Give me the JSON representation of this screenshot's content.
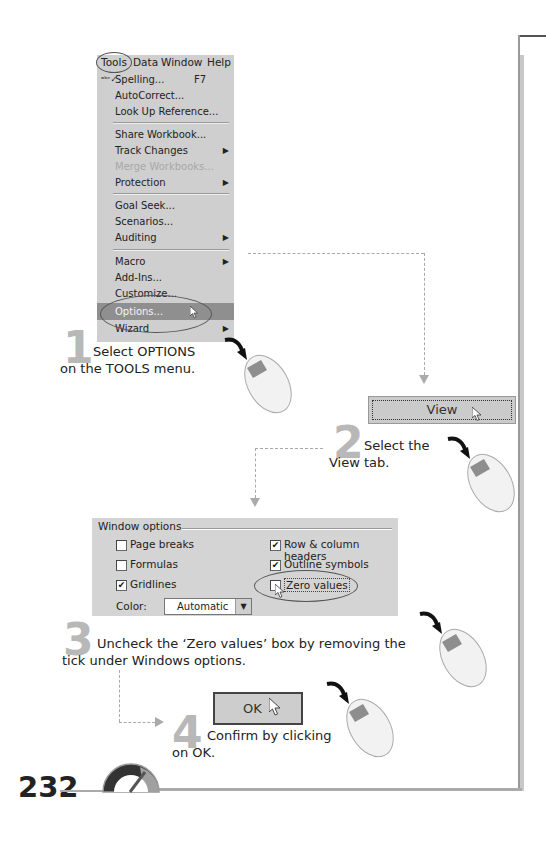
{
  "menu": {
    "menubar": [
      "Tools",
      "Data",
      "Window",
      "Help"
    ],
    "items": [
      {
        "label": "Spelling...",
        "shortcut": "F7",
        "icon": "spelling-icon"
      },
      {
        "label": "AutoCorrect..."
      },
      {
        "label": "Look Up Reference..."
      },
      {
        "label": "Share Workbook..."
      },
      {
        "label": "Track Changes",
        "submenu": true
      },
      {
        "label": "Merge Workbooks...",
        "disabled": true
      },
      {
        "label": "Protection",
        "submenu": true
      },
      {
        "label": "Goal Seek..."
      },
      {
        "label": "Scenarios..."
      },
      {
        "label": "Auditing",
        "submenu": true
      },
      {
        "label": "Macro",
        "submenu": true
      },
      {
        "label": "Add-Ins..."
      },
      {
        "label": "Customize..."
      },
      {
        "label": "Options...",
        "highlighted": true
      },
      {
        "label": "Wizard",
        "submenu": true
      }
    ],
    "submenu_arrow": "▶"
  },
  "steps": [
    {
      "number": "1",
      "text_line1": "Select OPTIONS",
      "text_line2": "on the TOOLS menu."
    },
    {
      "number": "2",
      "text_line1": "Select the",
      "text_line2": "View tab."
    },
    {
      "number": "3",
      "text_line1": "Uncheck the ‘Zero values’ box by removing the",
      "text_line2": "tick under Windows options."
    },
    {
      "number": "4",
      "text_line1": "Confirm by clicking",
      "text_line2": "on OK."
    }
  ],
  "view_tab": {
    "label": "View"
  },
  "dialog": {
    "group_title": "Window options",
    "checkboxes": [
      {
        "label": "Page breaks",
        "checked": false
      },
      {
        "label": "Formulas",
        "checked": false
      },
      {
        "label": "Gridlines",
        "checked": true
      },
      {
        "label": "Row & column headers",
        "checked": true
      },
      {
        "label": "Outline symbols",
        "checked": true
      },
      {
        "label": "Zero values",
        "checked": false
      }
    ],
    "check_mark": "✔",
    "color_label": "Color:",
    "color_value": "Automatic",
    "dropdown_arrow": "▼"
  },
  "ok_button": {
    "label": "OK"
  },
  "page_number": "232",
  "colors": {
    "menu_bg": "#cfcfcf",
    "highlight": "#8f8f8f",
    "step_number": "#b8b8b8",
    "connector": "#aaaaaa"
  }
}
